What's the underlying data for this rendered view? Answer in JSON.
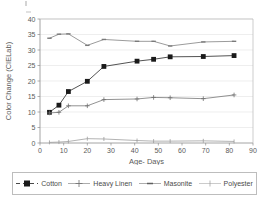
{
  "chart_data": {
    "type": "line",
    "title": "",
    "xlabel": "Age- Days",
    "ylabel": "Color Change (CIELab)",
    "xlim": [
      0,
      90
    ],
    "ylim": [
      0,
      40
    ],
    "xticks": [
      0,
      10,
      20,
      30,
      40,
      50,
      60,
      70,
      80,
      90
    ],
    "yticks": [
      0,
      5,
      10,
      15,
      20,
      25,
      30,
      35,
      40
    ],
    "grid": "horizontal",
    "legend_position": "bottom",
    "series": [
      {
        "name": "Cotton",
        "marker": "filled-square",
        "color": "#1a1a1a",
        "points": [
          {
            "x": 4,
            "y": 9.9
          },
          {
            "x": 8,
            "y": 12.2
          },
          {
            "x": 12,
            "y": 16.6
          },
          {
            "x": 20,
            "y": 19.9
          },
          {
            "x": 27,
            "y": 24.7
          },
          {
            "x": 41,
            "y": 26.4
          },
          {
            "x": 48,
            "y": 27.0
          },
          {
            "x": 55,
            "y": 27.8
          },
          {
            "x": 69,
            "y": 27.9
          },
          {
            "x": 82,
            "y": 28.2
          }
        ]
      },
      {
        "name": "Heavy Linen",
        "marker": "plus",
        "color": "#6e6e6e",
        "points": [
          {
            "x": 4,
            "y": 9.7
          },
          {
            "x": 8,
            "y": 9.9
          },
          {
            "x": 12,
            "y": 12.0
          },
          {
            "x": 20,
            "y": 12.0
          },
          {
            "x": 27,
            "y": 14.0
          },
          {
            "x": 41,
            "y": 14.2
          },
          {
            "x": 48,
            "y": 14.7
          },
          {
            "x": 55,
            "y": 14.6
          },
          {
            "x": 69,
            "y": 14.3
          },
          {
            "x": 82,
            "y": 15.5
          }
        ]
      },
      {
        "name": "Masonite",
        "marker": "dash",
        "color": "#7a7a7a",
        "points": [
          {
            "x": 4,
            "y": 33.8
          },
          {
            "x": 8,
            "y": 35.1
          },
          {
            "x": 12,
            "y": 35.2
          },
          {
            "x": 20,
            "y": 31.5
          },
          {
            "x": 27,
            "y": 33.4
          },
          {
            "x": 41,
            "y": 32.8
          },
          {
            "x": 48,
            "y": 32.8
          },
          {
            "x": 55,
            "y": 31.3
          },
          {
            "x": 69,
            "y": 32.6
          },
          {
            "x": 82,
            "y": 32.8
          }
        ]
      },
      {
        "name": "Polyester",
        "marker": "tick",
        "color": "#9a9a9a",
        "points": [
          {
            "x": 4,
            "y": 0.2
          },
          {
            "x": 8,
            "y": 0.3
          },
          {
            "x": 12,
            "y": 0.5
          },
          {
            "x": 20,
            "y": 1.4
          },
          {
            "x": 27,
            "y": 1.3
          },
          {
            "x": 41,
            "y": 0.8
          },
          {
            "x": 48,
            "y": 0.6
          },
          {
            "x": 55,
            "y": 0.6
          },
          {
            "x": 69,
            "y": 0.7
          },
          {
            "x": 82,
            "y": 0.5
          }
        ]
      }
    ]
  },
  "legend": {
    "items": [
      {
        "label": "Cotton"
      },
      {
        "label": "Heavy Linen"
      },
      {
        "label": "Masonite"
      },
      {
        "label": "Polyester"
      }
    ]
  }
}
